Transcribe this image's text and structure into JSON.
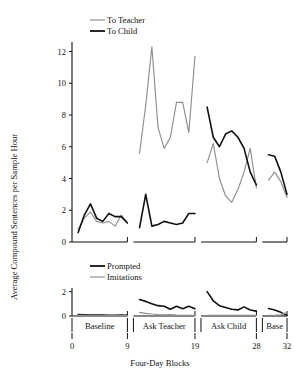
{
  "chart_data": {
    "type": "line",
    "title": "",
    "xlabel": "Four-Day Blocks",
    "ylabel": "Average Compound Sentences per Sample Hour",
    "grid": false,
    "xlim": [
      0,
      32
    ],
    "xticks": [
      0,
      9,
      19,
      28,
      32
    ],
    "xticklabels": [
      "0",
      "9",
      "19",
      "28",
      "32"
    ],
    "phases": [
      {
        "label": "Baseline",
        "x_start": 0,
        "x_end": 9
      },
      {
        "label": "Ask Teacher",
        "x_start": 9,
        "x_end": 19
      },
      {
        "label": "Ask Child",
        "x_start": 19,
        "x_end": 28
      },
      {
        "label": "Base",
        "x_start": 28,
        "x_end": 32
      }
    ],
    "panels": [
      {
        "name": "upper-panel",
        "ylim": [
          0,
          12.6
        ],
        "yticks": [
          0,
          2,
          4,
          6,
          8,
          10,
          12
        ],
        "yticklabels": [
          "0",
          "2",
          "4",
          "6",
          "8",
          "10",
          "12"
        ],
        "legend_position": "top-left",
        "series": [
          {
            "name": "To Teacher",
            "color": "#8e8e8e",
            "segments": [
              {
                "phase": "Baseline",
                "x": [
                  1,
                  2,
                  3,
                  4,
                  5,
                  6,
                  7,
                  8,
                  9
                ],
                "y": [
                  0.8,
                  1.5,
                  1.9,
                  1.3,
                  1.2,
                  1.3,
                  1.0,
                  1.7,
                  1.2
                ]
              },
              {
                "phase": "Ask Teacher",
                "x": [
                  10,
                  11,
                  12,
                  13,
                  14,
                  15,
                  16,
                  17,
                  18,
                  19
                ],
                "y": [
                  5.6,
                  8.6,
                  12.3,
                  7.2,
                  5.9,
                  6.6,
                  8.8,
                  8.8,
                  6.9,
                  11.7
                ]
              },
              {
                "phase": "Ask Child",
                "x": [
                  20,
                  21,
                  22,
                  23,
                  24,
                  25,
                  26,
                  27,
                  28
                ],
                "y": [
                  5.0,
                  6.2,
                  4.0,
                  2.9,
                  2.5,
                  3.3,
                  4.4,
                  5.9,
                  3.4
                ]
              },
              {
                "phase": "Base",
                "x": [
                  29,
                  30,
                  31,
                  32
                ],
                "y": [
                  3.9,
                  4.4,
                  3.8,
                  2.8
                ]
              }
            ]
          },
          {
            "name": "To Child",
            "color": "#111111",
            "segments": [
              {
                "phase": "Baseline",
                "x": [
                  1,
                  2,
                  3,
                  4,
                  5,
                  6,
                  7,
                  8,
                  9
                ],
                "y": [
                  0.6,
                  1.7,
                  2.4,
                  1.5,
                  1.3,
                  1.8,
                  1.6,
                  1.6,
                  1.2
                ]
              },
              {
                "phase": "Ask Teacher",
                "x": [
                  10,
                  11,
                  12,
                  13,
                  14,
                  15,
                  16,
                  17,
                  18,
                  19
                ],
                "y": [
                  0.9,
                  3.0,
                  1.0,
                  1.1,
                  1.3,
                  1.2,
                  1.1,
                  1.2,
                  1.8,
                  1.8
                ]
              },
              {
                "phase": "Ask Child",
                "x": [
                  20,
                  21,
                  22,
                  23,
                  24,
                  25,
                  26,
                  27,
                  28
                ],
                "y": [
                  8.5,
                  6.6,
                  6.0,
                  6.8,
                  7.0,
                  6.6,
                  5.9,
                  4.4,
                  3.6
                ]
              },
              {
                "phase": "Base",
                "x": [
                  29,
                  30,
                  31,
                  32
                ],
                "y": [
                  5.5,
                  5.4,
                  4.4,
                  3.0
                ]
              }
            ]
          }
        ]
      },
      {
        "name": "lower-panel",
        "ylim": [
          0,
          2.3
        ],
        "yticks": [
          0,
          2
        ],
        "yticklabels": [
          "0",
          "2"
        ],
        "legend_position": "top-left",
        "series": [
          {
            "name": "Prompted",
            "color": "#111111",
            "segments": [
              {
                "phase": "Baseline",
                "x": [
                  1,
                  2,
                  3,
                  4,
                  5,
                  6,
                  7,
                  8,
                  9
                ],
                "y": [
                  0.12,
                  0.1,
                  0.08,
                  0.07,
                  0.07,
                  0.06,
                  0.06,
                  0.07,
                  0.06
                ]
              },
              {
                "phase": "Ask Teacher",
                "x": [
                  10,
                  11,
                  12,
                  13,
                  14,
                  15,
                  16,
                  17,
                  18,
                  19
                ],
                "y": [
                  1.35,
                  1.2,
                  1.0,
                  0.85,
                  0.8,
                  0.55,
                  0.8,
                  0.6,
                  0.8,
                  0.6
                ]
              },
              {
                "phase": "Ask Child",
                "x": [
                  20,
                  21,
                  22,
                  23,
                  24,
                  25,
                  26,
                  27,
                  28
                ],
                "y": [
                  2.0,
                  1.25,
                  0.85,
                  0.7,
                  0.55,
                  0.5,
                  0.75,
                  0.5,
                  0.4
                ]
              },
              {
                "phase": "Base",
                "x": [
                  29,
                  30,
                  31,
                  32
                ],
                "y": [
                  0.62,
                  0.5,
                  0.3,
                  0.05
                ]
              }
            ]
          },
          {
            "name": "Imitations",
            "color": "#8e8e8e",
            "segments": [
              {
                "phase": "Baseline",
                "x": [
                  1,
                  2,
                  3,
                  4,
                  5,
                  6,
                  7,
                  8,
                  9
                ],
                "y": [
                  0.05,
                  0.05,
                  0.04,
                  0.04,
                  0.04,
                  0.04,
                  0.04,
                  0.04,
                  0.04
                ]
              },
              {
                "phase": "Ask Teacher",
                "x": [
                  10,
                  11,
                  12,
                  13,
                  14,
                  15,
                  16,
                  17,
                  18,
                  19
                ],
                "y": [
                  0.3,
                  0.22,
                  0.16,
                  0.12,
                  0.1,
                  0.12,
                  0.08,
                  0.06,
                  0.05,
                  0.05
                ]
              },
              {
                "phase": "Ask Child",
                "x": [
                  20,
                  21,
                  22,
                  23,
                  24,
                  25,
                  26,
                  27,
                  28
                ],
                "y": [
                  0.06,
                  0.05,
                  0.05,
                  0.05,
                  0.05,
                  0.05,
                  0.05,
                  0.05,
                  0.05
                ]
              },
              {
                "phase": "Base",
                "x": [
                  29,
                  30,
                  31,
                  32
                ],
                "y": [
                  0.05,
                  0.05,
                  0.1,
                  0.3
                ]
              }
            ]
          }
        ]
      }
    ],
    "legends": [
      {
        "panel": "upper-panel",
        "entries": [
          {
            "label": "To Teacher",
            "color": "#8e8e8e"
          },
          {
            "label": "To Child",
            "color": "#111111"
          }
        ]
      },
      {
        "panel": "lower-panel",
        "entries": [
          {
            "label": "Prompted",
            "color": "#111111"
          },
          {
            "label": "Imitations",
            "color": "#8e8e8e"
          }
        ]
      }
    ]
  }
}
